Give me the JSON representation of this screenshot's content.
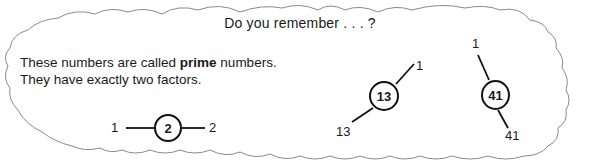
{
  "title": "Do you remember . . . ?",
  "text": {
    "line1_before": "These numbers are called ",
    "line1_bold": "prime",
    "line1_after": " numbers.",
    "line2": "They have exactly two factors."
  },
  "factor_diagrams": [
    {
      "number": "2",
      "factors": [
        "1",
        "2"
      ]
    },
    {
      "number": "13",
      "factors": [
        "1",
        "13"
      ]
    },
    {
      "number": "41",
      "factors": [
        "1",
        "41"
      ]
    }
  ],
  "colors": {
    "outline": "#8a8a8a",
    "ink": "#111111",
    "background": "#ffffff"
  }
}
